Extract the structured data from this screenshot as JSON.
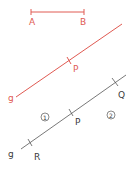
{
  "colors": {
    "red": "#e05a52",
    "gray": "#555555",
    "text_dark": "#3a3a3a"
  },
  "segment_ab": {
    "label_a": "A",
    "label_b": "B"
  },
  "red_line": {
    "label_g": "g",
    "label_p": "P"
  },
  "gray_line": {
    "label_g": "g",
    "label_q": "Q",
    "label_p": "P",
    "label_r": "R",
    "region_1": "1",
    "region_2": "2"
  }
}
